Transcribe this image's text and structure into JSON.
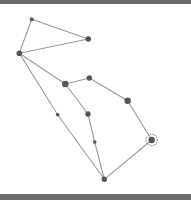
{
  "diagram": {
    "type": "constellation",
    "colors": {
      "background": "#ffffff",
      "border": "#6b6b6b",
      "line": "#9a9a9a",
      "star": "#555555"
    },
    "stars": [
      {
        "id": "A",
        "x": 31.7,
        "y": 19.3,
        "r": 2.0
      },
      {
        "id": "B",
        "x": 88.3,
        "y": 39.0,
        "r": 2.8
      },
      {
        "id": "C",
        "x": 19.3,
        "y": 53.3,
        "r": 2.8
      },
      {
        "id": "D",
        "x": 65.3,
        "y": 84.0,
        "r": 3.3
      },
      {
        "id": "E",
        "x": 89.3,
        "y": 78.0,
        "r": 2.7
      },
      {
        "id": "F",
        "x": 127.7,
        "y": 100.7,
        "r": 3.2
      },
      {
        "id": "G",
        "x": 151.7,
        "y": 140.0,
        "r": 3.2,
        "halo": true
      },
      {
        "id": "H",
        "x": 57.7,
        "y": 114.7,
        "r": 1.8
      },
      {
        "id": "I",
        "x": 88.0,
        "y": 114.0,
        "r": 2.7
      },
      {
        "id": "J",
        "x": 94.7,
        "y": 142.0,
        "r": 1.8
      },
      {
        "id": "K",
        "x": 104.3,
        "y": 179.3,
        "r": 2.7
      }
    ],
    "edges": [
      [
        "A",
        "B"
      ],
      [
        "A",
        "C"
      ],
      [
        "B",
        "C"
      ],
      [
        "C",
        "D"
      ],
      [
        "D",
        "E"
      ],
      [
        "E",
        "F"
      ],
      [
        "F",
        "G"
      ],
      [
        "G",
        "K"
      ],
      [
        "C",
        "H"
      ],
      [
        "H",
        "K"
      ],
      [
        "D",
        "I"
      ],
      [
        "I",
        "J"
      ],
      [
        "J",
        "K"
      ]
    ]
  }
}
